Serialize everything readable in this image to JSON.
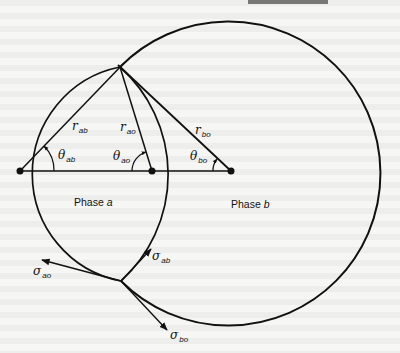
{
  "figure": {
    "heading_fragment": "",
    "phase_labels": {
      "a": {
        "text": "Phase",
        "letter": "a"
      },
      "b": {
        "text": "Phase",
        "letter": "b"
      }
    },
    "radii": [
      {
        "symbol": "r",
        "subscript": "ab"
      },
      {
        "symbol": "r",
        "subscript": "ao"
      },
      {
        "symbol": "r",
        "subscript": "bo"
      }
    ],
    "angles": [
      {
        "symbol": "θ",
        "subscript": "ab"
      },
      {
        "symbol": "θ",
        "subscript": "ao"
      },
      {
        "symbol": "θ",
        "subscript": "bo"
      }
    ],
    "tensions": [
      {
        "symbol": "σ",
        "subscript": "ao"
      },
      {
        "symbol": "σ",
        "subscript": "ab"
      },
      {
        "symbol": "σ",
        "subscript": "bo"
      }
    ],
    "colors": {
      "ink": "#111111",
      "paper": "#f6f6f4"
    }
  }
}
